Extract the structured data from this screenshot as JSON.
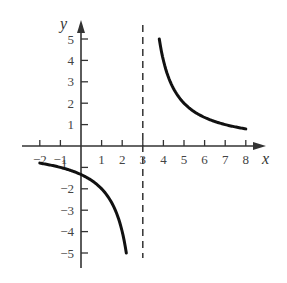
{
  "chart_data": {
    "type": "line",
    "title": "",
    "function": "y = 4/(x - 3)",
    "xlabel": "x",
    "ylabel": "y",
    "xlim": [
      -2,
      8
    ],
    "ylim": [
      -5,
      5
    ],
    "grid": false,
    "x_ticks": [
      -2,
      -1,
      1,
      2,
      3,
      4,
      5,
      6,
      7,
      8
    ],
    "y_ticks": [
      -5,
      -4,
      -3,
      -2,
      -1,
      1,
      2,
      3,
      4,
      5
    ],
    "x_tick_labels": [
      "−2",
      "−1",
      "1",
      "2",
      "3",
      "4",
      "5",
      "6",
      "7",
      "8"
    ],
    "y_tick_labels": [
      "−5",
      "−4",
      "−3",
      "−2",
      "−1",
      "1",
      "2",
      "3",
      "4",
      "5"
    ],
    "asymptote": {
      "type": "vertical",
      "x": 3,
      "style": "dashed"
    },
    "series": [
      {
        "name": "left branch",
        "x": [
          -2,
          -1,
          0,
          1,
          2,
          2.2
        ],
        "values": [
          -0.8,
          -1,
          -1.33,
          -2,
          -4,
          -5
        ]
      },
      {
        "name": "right branch",
        "x": [
          3.8,
          4,
          5,
          6,
          7,
          8
        ],
        "values": [
          5,
          4,
          2,
          1.33,
          1,
          0.8
        ]
      }
    ]
  }
}
